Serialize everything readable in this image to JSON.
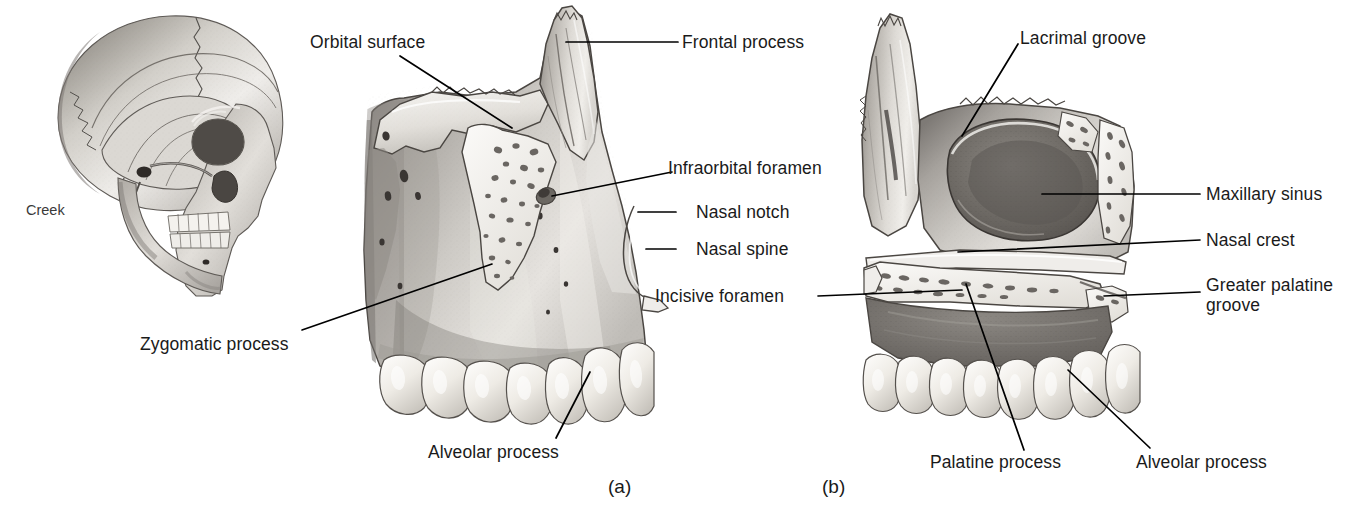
{
  "figure": {
    "signature": "Creek",
    "panels": [
      {
        "id": "a",
        "caption": "(a)",
        "view": "lateral-view-maxilla"
      },
      {
        "id": "b",
        "caption": "(b)",
        "view": "medial-view-maxilla"
      }
    ]
  },
  "labels": {
    "orbital_surface": "Orbital surface",
    "frontal_process": "Frontal process",
    "lacrimal_groove": "Lacrimal groove",
    "infraorbital_foramen": "Infraorbital foramen",
    "nasal_notch": "Nasal notch",
    "nasal_spine": "Nasal spine",
    "incisive_foramen": "Incisive foramen",
    "maxillary_sinus": "Maxillary sinus",
    "nasal_crest": "Nasal crest",
    "greater_palatine_groove": "Greater palatine groove",
    "zygomatic_process": "Zygomatic process",
    "alveolar_process_a": "Alveolar process",
    "palatine_process": "Palatine process",
    "alveolar_process_b": "Alveolar process"
  },
  "colors": {
    "background": "#ffffff",
    "ink": "#1a1a1a",
    "leader": "#000000",
    "bone_light": "#f2f0ec",
    "bone_mid": "#c9c5bf",
    "bone_dark": "#8e8a85",
    "bone_shadow": "#5f5c58",
    "tooth": "#ece9e3",
    "cavity": "#6e6a65"
  }
}
